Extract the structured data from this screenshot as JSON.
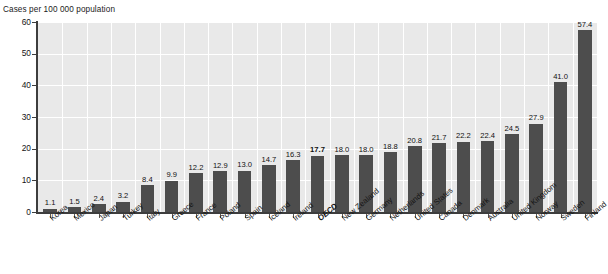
{
  "chart_data": {
    "type": "bar",
    "title": "",
    "ylabel": "Cases per 100 000 population",
    "xlabel": "",
    "ylim": [
      0,
      60
    ],
    "yticks": [
      0,
      10,
      20,
      30,
      40,
      50,
      60
    ],
    "grid": true,
    "legend": "none",
    "bar_color": "#4d4d4d",
    "plot_background": "#e9e9e9",
    "gridline_color": "#ffffff",
    "highlight_category": "OECD",
    "categories": [
      "Korea",
      "Mexico",
      "Japan",
      "Turkey",
      "Italy",
      "Greece",
      "France",
      "Poland",
      "Spain",
      "Iceland",
      "Ireland",
      "OECD",
      "New Zealand",
      "Germany",
      "Netherlands",
      "United States",
      "Canada",
      "Denmark",
      "Australia",
      "United Kingdom",
      "Norway",
      "Sweden",
      "Finland"
    ],
    "values": [
      1.1,
      1.5,
      2.4,
      3.2,
      8.4,
      9.9,
      12.2,
      12.9,
      13.0,
      14.7,
      16.3,
      17.7,
      18.0,
      18.0,
      18.8,
      20.8,
      21.7,
      22.2,
      22.4,
      24.5,
      27.9,
      41.0,
      57.4
    ],
    "value_labels": [
      "1.1",
      "1.5",
      "2.4",
      "3.2",
      "8.4",
      "9.9",
      "12.2",
      "12.9",
      "13.0",
      "14.7",
      "16.3",
      "17.7",
      "18.0",
      "18.0",
      "18.8",
      "20.8",
      "21.7",
      "22.2",
      "22.4",
      "24.5",
      "27.9",
      "41.0",
      "57.4"
    ],
    "ytick_labels": [
      "0",
      "10",
      "20",
      "30",
      "40",
      "50",
      "60"
    ]
  }
}
